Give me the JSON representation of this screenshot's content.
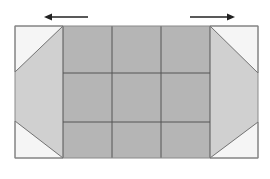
{
  "diagram": {
    "arrows": [
      {
        "id": "left",
        "direction": "left",
        "x1": 88,
        "x2": 42,
        "y": 17
      },
      {
        "id": "right",
        "direction": "right",
        "x1": 190,
        "x2": 237,
        "y": 17
      }
    ],
    "outer": {
      "x": 15,
      "y": 26,
      "width": 243,
      "height": 132
    },
    "grid": {
      "rows": 3,
      "cols": 3,
      "x_lines": [
        63,
        112,
        161,
        210
      ],
      "y_lines": [
        26,
        73,
        122,
        158
      ]
    },
    "colors": {
      "grid_fill": "#b5b5b5",
      "flap_fill": "#d0d0d0",
      "corner_fill": "#f5f5f5",
      "line": "#555555",
      "outer_line": "#8a8a8a",
      "arrow": "#222222"
    }
  }
}
